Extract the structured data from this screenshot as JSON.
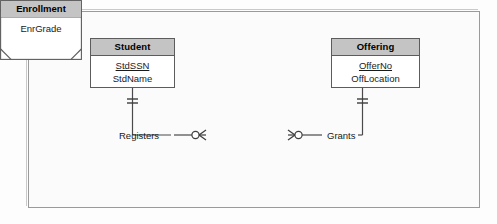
{
  "diagram": {
    "type": "entity-relationship-diagram",
    "notation": "crows-foot",
    "background_color": "#fbfbfb",
    "frame_border_color": "#9a9a9a",
    "entity_header_color": "#c4c4c4",
    "entity_body_color": "#ffffff",
    "line_color": "#4a4a4a",
    "entities": [
      {
        "id": "student",
        "name": "Student",
        "shape": "rectangle",
        "attributes": [
          {
            "name": "StdSSN",
            "primary_key": true
          },
          {
            "name": "StdName",
            "primary_key": false
          }
        ]
      },
      {
        "id": "offering",
        "name": "Offering",
        "shape": "rectangle",
        "attributes": [
          {
            "name": "OfferNo",
            "primary_key": true
          },
          {
            "name": "OffLocation",
            "primary_key": false
          }
        ]
      },
      {
        "id": "enrollment",
        "name": "Enrollment",
        "shape": "associative-entity",
        "attributes": [
          {
            "name": "EnrGrade",
            "primary_key": false
          }
        ]
      }
    ],
    "relationships": [
      {
        "id": "registers",
        "name": "Registers",
        "from": "student",
        "to": "enrollment",
        "from_cardinality": "exactly-one",
        "to_cardinality": "zero-or-many"
      },
      {
        "id": "grants",
        "name": "Grants",
        "from": "offering",
        "to": "enrollment",
        "from_cardinality": "exactly-one",
        "to_cardinality": "zero-or-many"
      }
    ]
  }
}
